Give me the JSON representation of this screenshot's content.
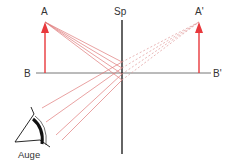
{
  "diagram": {
    "labels": {
      "object_top": "A",
      "object_base": "B",
      "mirror": "Sp",
      "image_top": "A'",
      "image_base": "B'",
      "eye": "Auge"
    },
    "colors": {
      "ray": "#e07070",
      "arrow": "#e8383c",
      "line": "#222222",
      "baseline": "#666666"
    }
  }
}
